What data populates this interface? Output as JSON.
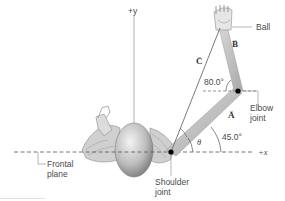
{
  "diagram": {
    "axes": {
      "y_label": "+y",
      "x_label": "+x"
    },
    "vectors": {
      "A": "A",
      "B": "B",
      "C": "C"
    },
    "angles": {
      "elbow_angle": "80.0°",
      "shoulder_angle": "45.0°",
      "theta": "θ"
    },
    "labels": {
      "ball": "Ball",
      "elbow_line1": "Elbow",
      "elbow_line2": "joint",
      "shoulder_line1": "Shoulder",
      "shoulder_line2": "joint",
      "frontal_line1": "Frontal",
      "frontal_line2": "plane"
    },
    "colors": {
      "line": "#8a8a8a",
      "arm": "#b5b5b5",
      "joint": "#000000",
      "text": "#4a4a4a"
    }
  }
}
